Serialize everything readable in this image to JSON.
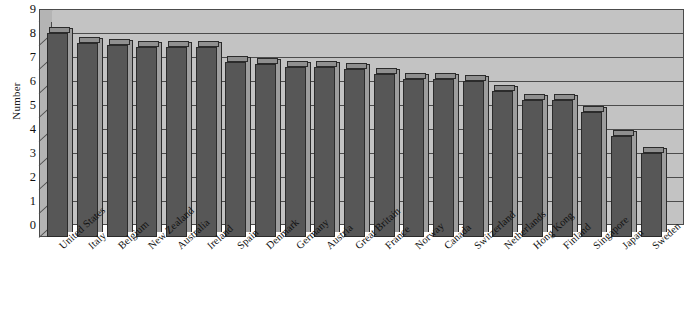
{
  "chart_data": {
    "type": "bar",
    "title": "",
    "subtitle": "",
    "xlabel": "",
    "ylabel": "Number",
    "ylim": [
      0,
      9
    ],
    "ytick_step": 1,
    "yticks": [
      "9",
      "8",
      "7",
      "6",
      "5",
      "4",
      "3",
      "2",
      "1",
      "0"
    ],
    "grid": true,
    "legend": false,
    "legend_position": "none",
    "style_3d": true,
    "categories": [
      "United States",
      "Italy",
      "Belgium",
      "New Zealand",
      "Australia",
      "Ireland",
      "Spain",
      "Denmark",
      "Germany",
      "Austria",
      "Great Britain",
      "France",
      "Norway",
      "Canada",
      "Switzerland",
      "Netherlands",
      "Hong Kong",
      "Finland",
      "Singapore",
      "Japan",
      "Sweden"
    ],
    "values": [
      8.5,
      8.1,
      8.0,
      7.9,
      7.9,
      7.9,
      7.3,
      7.2,
      7.1,
      7.1,
      7.0,
      6.8,
      6.6,
      6.6,
      6.5,
      6.1,
      5.7,
      5.7,
      5.2,
      4.2,
      3.5
    ]
  },
  "colors": {
    "bar_face": "#575757",
    "bar_side": "#9d9d9d",
    "bar_top": "#8f8f8f",
    "plot_background": "#c3c3c3",
    "left_wall": "#b4b4b4",
    "gridline": "#4c4c4c",
    "axis_text": "#111111",
    "page_background": "#ffffff"
  }
}
